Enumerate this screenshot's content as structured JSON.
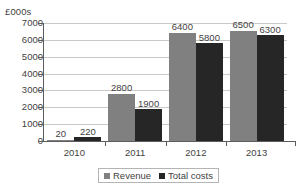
{
  "chart_data": {
    "type": "bar",
    "title": "",
    "subtitle": "",
    "xlabel": "",
    "ylabel": "£000s",
    "categories": [
      "2010",
      "2011",
      "2012",
      "2013"
    ],
    "series": [
      {
        "name": "Revenue",
        "color": "#808080",
        "values": [
          20,
          2800,
          6400,
          6500
        ]
      },
      {
        "name": "Total costs",
        "color": "#262626",
        "values": [
          220,
          1900,
          5800,
          6300
        ]
      }
    ],
    "ylim": [
      0,
      7000
    ],
    "y_ticks": [
      "0",
      "1000",
      "2000",
      "3000",
      "4000",
      "5000",
      "6000",
      "7000"
    ],
    "y_tick_values": [
      0,
      1000,
      2000,
      3000,
      4000,
      5000,
      6000,
      7000
    ],
    "grid": true,
    "grid_axis": "y",
    "legend_position": "bottom-center",
    "data_labels": {
      "2010": {
        "Revenue": "20",
        "Total costs": "220"
      },
      "2011": {
        "Revenue": "2800",
        "Total costs": "1900"
      },
      "2012": {
        "Revenue": "6400",
        "Total costs": "5800"
      },
      "2013": {
        "Revenue": "6500",
        "Total costs": "6300"
      }
    },
    "colors": {
      "revenue": "#808080",
      "total_costs": "#262626",
      "gridline": "#c9c9c9",
      "axis": "#5d5d5d",
      "text": "#3f3f3f",
      "background": "#ffffff"
    }
  },
  "axis": {
    "y_title": "£000s"
  },
  "legend": {
    "entries": [
      {
        "label": "Revenue"
      },
      {
        "label": "Total costs"
      }
    ]
  }
}
